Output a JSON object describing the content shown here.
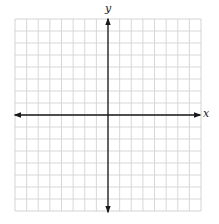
{
  "diagram": {
    "type": "coordinate-plane",
    "x_axis_label": "x",
    "y_axis_label": "y",
    "grid": {
      "columns": 16,
      "rows": 16,
      "columns_left_of_origin": 8,
      "columns_right_of_origin": 8,
      "rows_above_origin": 8,
      "rows_below_origin": 8,
      "line_color": "#d4d4d4",
      "border_color": "#cfcfcf"
    },
    "axes": {
      "color": "#1a1a1a",
      "arrows": "both-ends"
    }
  }
}
